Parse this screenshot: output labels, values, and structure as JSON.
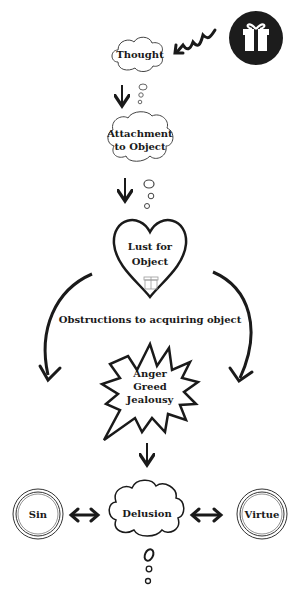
{
  "diagram": {
    "nodes": {
      "gift": {
        "label": "",
        "icon": "gift-icon"
      },
      "thought": {
        "label": "Thought"
      },
      "attachment": {
        "label_line1": "Attachment",
        "label_line2": "to Object"
      },
      "lust": {
        "label_line1": "Lust for",
        "label_line2": "Object"
      },
      "obstructions": {
        "label": "Obstructions to acquiring object"
      },
      "emotions": {
        "line1": "Anger",
        "line2": "Greed",
        "line3": "Jealousy"
      },
      "sin": {
        "label": "Sin"
      },
      "delusion": {
        "label": "Delusion"
      },
      "virtue": {
        "label": "Virtue"
      }
    },
    "colors": {
      "ink": "#1a1a1a",
      "gift_bg": "#1c1c1c",
      "paper": "#ffffff"
    }
  }
}
